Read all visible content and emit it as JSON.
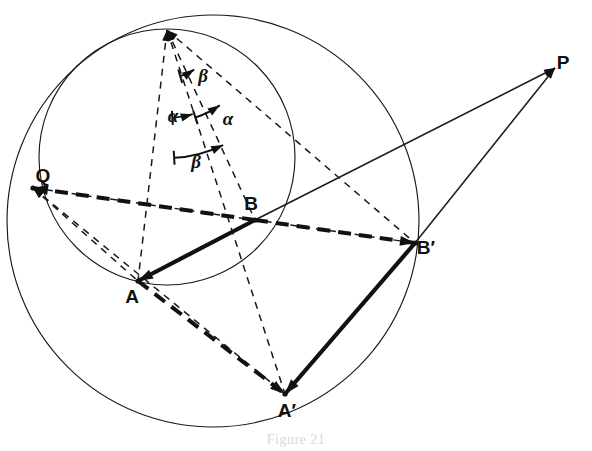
{
  "figure": {
    "caption": "Figure 21",
    "background_color": "#ffffff",
    "ink_color": "#111111"
  },
  "points": [
    {
      "id": "apex",
      "label": "",
      "x": 167,
      "y": 30,
      "label_dx": 0,
      "label_dy": 0,
      "marker": "arrow-into"
    },
    {
      "id": "Q",
      "label": "Q",
      "x": 33,
      "y": 188,
      "label_dx": 10,
      "label_dy": -6,
      "marker": "node"
    },
    {
      "id": "A",
      "label": "A",
      "x": 138,
      "y": 281,
      "label_dx": -6,
      "label_dy": 22,
      "marker": "node"
    },
    {
      "id": "B",
      "label": "B",
      "x": 255,
      "y": 220,
      "label_dx": -4,
      "label_dy": -10,
      "marker": "node"
    },
    {
      "id": "Aprime",
      "label": "A′",
      "x": 285,
      "y": 394,
      "label_dx": 2,
      "label_dy": 23,
      "marker": "node"
    },
    {
      "id": "Bprime",
      "label": "B′",
      "x": 415,
      "y": 243,
      "label_dx": 11,
      "label_dy": 11,
      "marker": "node"
    },
    {
      "id": "P",
      "label": "P",
      "x": 555,
      "y": 68,
      "label_dx": 8,
      "label_dy": 1,
      "marker": "arrow-into"
    }
  ],
  "circles": [
    {
      "id": "small-circle",
      "cx": 167,
      "cy": 157,
      "r": 128,
      "style": "thin-solid"
    },
    {
      "id": "large-circle",
      "cx": 213,
      "cy": 221,
      "r": 206,
      "style": "thin-solid"
    }
  ],
  "segments": [
    {
      "id": "apex-to-A",
      "from": "apex",
      "to": "A",
      "style": "thin-dash",
      "arrow_at": "from"
    },
    {
      "id": "apex-to-B",
      "from": "apex",
      "to": "B",
      "style": "thin-dash",
      "arrow_at": "from"
    },
    {
      "id": "apex-to-Aprime",
      "from": "apex",
      "to": "Aprime",
      "style": "thin-dash",
      "arrow_at": "from"
    },
    {
      "id": "apex-to-Bprime",
      "from": "apex",
      "to": "Bprime",
      "style": "thin-dash",
      "arrow_at": "from"
    },
    {
      "id": "Q-to-Bprime",
      "from": "Q",
      "to": "Bprime",
      "style": "thin-dash",
      "arrow_at": "from"
    },
    {
      "id": "Q-to-Aprime",
      "from": "Q",
      "to": "Aprime",
      "style": "thin-dash",
      "arrow_at": "from"
    },
    {
      "id": "Q-to-A",
      "from": "Q",
      "to": "A",
      "style": "thin-dash",
      "arrow_at": "from"
    },
    {
      "id": "B-to-P",
      "from": "B",
      "to": "P",
      "style": "thin-solid",
      "arrow_at": "to"
    },
    {
      "id": "Bprime-to-P",
      "from": "Bprime",
      "to": "P",
      "style": "thin-solid",
      "arrow_at": "to"
    },
    {
      "id": "A-to-B",
      "from": "A",
      "to": "B",
      "style": "thick-solid",
      "arrow_at": "from"
    },
    {
      "id": "Aprime-to-Bprime",
      "from": "Aprime",
      "to": "Bprime",
      "style": "thick-solid",
      "arrow_at": "from"
    },
    {
      "id": "B-to-Bprime",
      "from": "B",
      "to": "Bprime",
      "style": "thick-dash",
      "arrow_at": "to"
    },
    {
      "id": "A-to-Aprime",
      "from": "A",
      "to": "Aprime",
      "style": "thick-dash",
      "arrow_at": "to"
    },
    {
      "id": "Q-to-B",
      "from": "B",
      "to": "Q",
      "style": "thick-dash",
      "arrow_at": "to"
    }
  ],
  "angles": [
    {
      "id": "beta-upper",
      "label": "β",
      "label_x": 203,
      "label_y": 82,
      "arc_r": 48,
      "start_deg": 74.0,
      "end_deg": 55.5,
      "arrow_end": "end"
    },
    {
      "id": "alpha-left",
      "label": "α",
      "label_x": 173,
      "label_y": 122,
      "arc_r": 88,
      "start_deg": 86.5,
      "end_deg": 73.0,
      "arrow_end": "end"
    },
    {
      "id": "alpha-right",
      "label": "α",
      "label_x": 228,
      "label_y": 125,
      "arc_r": 92,
      "start_deg": 72.0,
      "end_deg": 55.0,
      "arrow_end": "end"
    },
    {
      "id": "beta-lower",
      "label": "β",
      "label_x": 196,
      "label_y": 168,
      "arc_r": 128,
      "start_deg": 86.8,
      "end_deg": 64.0,
      "arrow_end": "end"
    }
  ],
  "labels": {
    "apex": "",
    "Q": "Q",
    "A": "A",
    "B": "B",
    "A_prime": "A′",
    "B_prime": "B′",
    "P": "P",
    "alpha": "α",
    "beta": "β"
  }
}
